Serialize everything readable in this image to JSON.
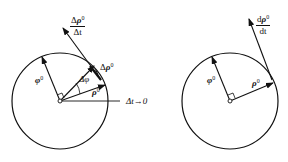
{
  "left_panel": {
    "title": "finite increment",
    "labels": {
      "rate_num_delta": "Δ",
      "rate_num_var": "ρ",
      "rate_num_sup": "0",
      "rate_den": "Δt",
      "delta_rho_delta": "Δ",
      "delta_rho_var": "ρ",
      "delta_rho_sup": "0",
      "phi_var": "φ",
      "phi_sup": "0",
      "rho_var": "ρ",
      "rho_sup": "0",
      "angle": "Δφ",
      "limit": "Δt→0"
    }
  },
  "right_panel": {
    "title": "derivative limit",
    "labels": {
      "deriv_num_d": "d",
      "deriv_num_var": "ρ",
      "deriv_num_sup": "0",
      "deriv_den": "dt",
      "phi_var": "φ",
      "phi_sup": "0",
      "rho_var": "ρ",
      "rho_sup": "0"
    }
  },
  "colors": {
    "stroke": "#111111",
    "background": "#ffffff"
  }
}
